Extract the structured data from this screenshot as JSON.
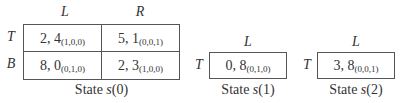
{
  "games": [
    {
      "caption_prefix": "State ",
      "caption_state": "s",
      "caption_arg": "(0)",
      "columns": [
        "L",
        "R"
      ],
      "rows": [
        {
          "label": "T",
          "cells": [
            {
              "payoff": "2, 4",
              "transition": "(1,0,0)"
            },
            {
              "payoff": "5, 1",
              "transition": "(0,0,1)"
            }
          ]
        },
        {
          "label": "B",
          "cells": [
            {
              "payoff": "8, 0",
              "transition": "(0,1,0)"
            },
            {
              "payoff": "2, 3",
              "transition": "(1,0,0)"
            }
          ]
        }
      ]
    },
    {
      "caption_prefix": "State ",
      "caption_state": "s",
      "caption_arg": "(1)",
      "columns": [
        "L"
      ],
      "rows": [
        {
          "label": "T",
          "cells": [
            {
              "payoff": "0, 8",
              "transition": "(0,1,0)"
            }
          ]
        }
      ]
    },
    {
      "caption_prefix": "State ",
      "caption_state": "s",
      "caption_arg": "(2)",
      "columns": [
        "L"
      ],
      "rows": [
        {
          "label": "T",
          "cells": [
            {
              "payoff": "3, 8",
              "transition": "(0,0,1)"
            }
          ]
        }
      ]
    }
  ]
}
